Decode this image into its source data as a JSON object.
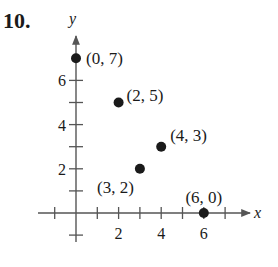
{
  "problem": {
    "number": "10."
  },
  "chart_data": {
    "type": "scatter",
    "title": "",
    "xlabel": "x",
    "ylabel": "y",
    "xlim": [
      -1.5,
      8.5
    ],
    "ylim": [
      -1.5,
      7.5
    ],
    "grid": false,
    "x_tick_labels": [
      "2",
      "4",
      "6"
    ],
    "y_tick_labels": [
      "2",
      "4",
      "6"
    ],
    "x_ticks": [
      -1,
      1,
      2,
      3,
      4,
      5,
      6,
      7
    ],
    "y_ticks": [
      -1,
      1,
      2,
      3,
      4,
      5,
      6
    ],
    "points": [
      {
        "x": 0,
        "y": 7,
        "label": "(0, 7)"
      },
      {
        "x": 2,
        "y": 5,
        "label": "(2, 5)"
      },
      {
        "x": 4,
        "y": 3,
        "label": "(4, 3)"
      },
      {
        "x": 3,
        "y": 2,
        "label": "(3, 2)"
      },
      {
        "x": 6,
        "y": 0,
        "label": "(6, 0)"
      }
    ],
    "legend": null
  },
  "colors": {
    "ink": "#1a1a1a",
    "axis": "#555555",
    "background": "#ffffff"
  }
}
